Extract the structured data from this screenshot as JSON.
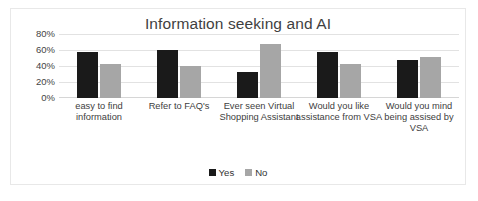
{
  "chart_data": {
    "type": "bar",
    "title": "Information seeking and AI",
    "xlabel": "",
    "ylabel": "",
    "ylim": [
      0,
      80
    ],
    "ytick_labels": [
      "80%",
      "60%",
      "40%",
      "20%",
      "0%"
    ],
    "ytick_values": [
      80,
      60,
      40,
      20,
      0
    ],
    "grid": true,
    "legend_position": "bottom-center",
    "categories": [
      "easy to find information",
      "Refer to FAQ's",
      "Ever seen Virtual Shopping Assistant",
      "Would you like assistance from VSA",
      "Would you mind being assised by VSA"
    ],
    "series": [
      {
        "name": "Yes",
        "color": "#1a1a1a",
        "values": [
          57,
          60,
          33,
          58,
          48
        ]
      },
      {
        "name": "No",
        "color": "#a6a6a6",
        "values": [
          43,
          40,
          67,
          42,
          51
        ]
      }
    ]
  },
  "legend": {
    "items": [
      {
        "label": "Yes",
        "swatch": "black-square"
      },
      {
        "label": "No",
        "swatch": "gray-square"
      }
    ]
  },
  "colors": {
    "yes": "#1a1a1a",
    "no": "#a6a6a6",
    "gridline": "#e2e2e2",
    "frame": "#e8e8e8",
    "title_text": "#3f3f3f"
  }
}
